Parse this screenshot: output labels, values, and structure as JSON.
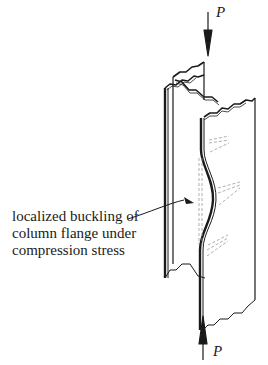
{
  "diagram": {
    "type": "structural-engineering-illustration",
    "loads": {
      "top": {
        "label": "P",
        "direction": "down"
      },
      "bottom": {
        "label": "P",
        "direction": "up"
      }
    },
    "annotation": {
      "lines": [
        "localized buckling of",
        "column flange under",
        "compression stress"
      ]
    },
    "colors": {
      "stroke": "#1a1a1a",
      "dashed": "#9a9a9a",
      "background": "#ffffff"
    }
  }
}
